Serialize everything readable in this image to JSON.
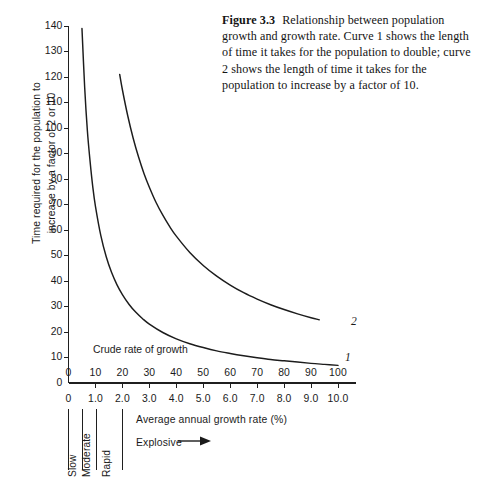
{
  "caption": {
    "figure_number": "Figure 3.3",
    "text": "Relationship between population growth and growth rate. Curve 1 shows the length of time it takes for the population to double; curve 2 shows the length of time it takes for the population to increase by a factor of 10."
  },
  "chart_data": {
    "type": "line",
    "title": "",
    "xlabel": "Average annual growth rate (%)",
    "ylabel": "Time required for the population to increase by a factor of 2 or 10",
    "xlim": [
      0,
      10.0
    ],
    "ylim": [
      0,
      140
    ],
    "grid": false,
    "legend_position": "inline-curve-labels",
    "y_ticks": [
      0,
      10,
      20,
      30,
      40,
      50,
      60,
      70,
      80,
      90,
      100,
      110,
      120,
      130,
      140
    ],
    "y_tick_labels": [
      "0",
      "10",
      "20",
      "30",
      "40",
      "50",
      "60",
      "70",
      "80",
      "90",
      "100",
      "110",
      "120",
      "130",
      "140"
    ],
    "x_ticks": [
      0,
      1.0,
      2.0,
      3.0,
      4.0,
      5.0,
      6.0,
      7.0,
      8.0,
      9.0,
      10.0
    ],
    "x_tick_labels_lower": [
      "0",
      "1.0",
      "2.0",
      "3.0",
      "4.0",
      "5.0",
      "6.0",
      "7.0",
      "8.0",
      "9.0",
      "10.0"
    ],
    "x_tick_labels_upper": [
      "0",
      "10",
      "20",
      "30",
      "40",
      "50",
      "60",
      "70",
      "80",
      "90",
      "100"
    ],
    "upper_axis_note": "Crude rate of growth",
    "annotations": [
      {
        "name": "crude-rate-of-growth",
        "text": "Crude rate of growth"
      }
    ],
    "series": [
      {
        "name": "1",
        "label": "1",
        "description": "Doubling time = 69.3 / growth rate (%)",
        "x": [
          0.5,
          0.6,
          0.7,
          0.8,
          0.9,
          1.0,
          1.2,
          1.4,
          1.6,
          1.8,
          2.0,
          2.25,
          2.5,
          2.75,
          3.0,
          3.5,
          4.0,
          4.5,
          5.0,
          5.5,
          6.0,
          6.5,
          7.0,
          7.5,
          8.0,
          8.5,
          9.0,
          9.5,
          10.0
        ],
        "y": [
          139,
          116,
          99,
          87,
          77,
          69.3,
          57.8,
          49.5,
          43.3,
          38.5,
          34.7,
          30.8,
          27.7,
          25.2,
          23.1,
          19.8,
          17.3,
          15.4,
          13.9,
          12.6,
          11.6,
          10.7,
          9.9,
          9.2,
          8.7,
          8.2,
          7.7,
          7.3,
          6.9
        ]
      },
      {
        "name": "2",
        "label": "2",
        "description": "Tenfold-increase time = 230.3 / growth rate (%)",
        "x": [
          1.9,
          2.0,
          2.2,
          2.4,
          2.6,
          2.8,
          3.0,
          3.25,
          3.5,
          3.75,
          4.0,
          4.5,
          5.0,
          5.5,
          6.0,
          6.5,
          7.0,
          7.5,
          8.0,
          8.5,
          9.0,
          9.3
        ],
        "y": [
          121,
          115,
          104.7,
          96,
          88.6,
          82.2,
          76.8,
          70.8,
          65.8,
          61.4,
          57.6,
          51.2,
          46.1,
          41.9,
          38.4,
          35.4,
          32.9,
          30.7,
          28.8,
          27.1,
          25.6,
          24.8
        ]
      }
    ]
  },
  "categories": {
    "vertical": [
      {
        "label": "Slow"
      },
      {
        "label": "Moderate"
      },
      {
        "label": "Rapid"
      }
    ],
    "explosive": "Explosive"
  },
  "colors": {
    "ink": "#1b1b1b",
    "curve": "#1c1c1c",
    "background": "#ffffff"
  }
}
